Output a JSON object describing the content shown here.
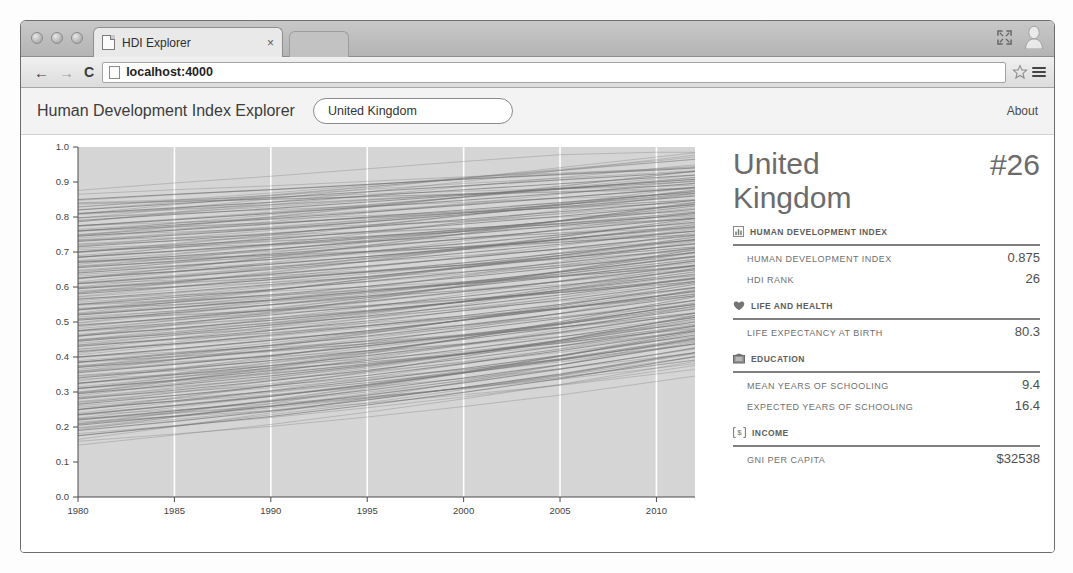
{
  "browser": {
    "tab_title": "HDI Explorer",
    "tab_close": "×",
    "url": "localhost:4000",
    "back": "←",
    "forward": "→",
    "reload": "C",
    "icons": {
      "favicon": "page-icon",
      "star": "star-icon",
      "menu": "hamburger-menu-icon",
      "fullscreen": "fullscreen-icon",
      "avatar": "user-avatar-icon"
    }
  },
  "app": {
    "title": "Human Development Index Explorer",
    "about_label": "About",
    "country_select": {
      "value": "United Kingdom",
      "placeholder": "United Kingdom"
    }
  },
  "detail": {
    "country_name": "United Kingdom",
    "rank_label": "#26",
    "sections": [
      {
        "icon": "bar-chart-icon",
        "title": "HUMAN DEVELOPMENT INDEX",
        "rows": [
          {
            "label": "HUMAN DEVELOPMENT INDEX",
            "value": "0.875"
          },
          {
            "label": "HDI RANK",
            "value": "26"
          }
        ]
      },
      {
        "icon": "heart-icon",
        "title": "LIFE AND HEALTH",
        "rows": [
          {
            "label": "LIFE EXPECTANCY AT BIRTH",
            "value": "80.3"
          }
        ]
      },
      {
        "icon": "book-icon",
        "title": "EDUCATION",
        "rows": [
          {
            "label": "MEAN YEARS OF SCHOOLING",
            "value": "9.4"
          },
          {
            "label": "EXPECTED YEARS OF SCHOOLING",
            "value": "16.4"
          }
        ]
      },
      {
        "icon": "dollar-icon",
        "title": "INCOME",
        "rows": [
          {
            "label": "GNI PER CAPITA",
            "value": "$32538"
          }
        ]
      }
    ]
  },
  "chart_data": {
    "type": "line",
    "title": "",
    "xlabel": "",
    "ylabel": "",
    "xlim": [
      1980,
      2012
    ],
    "ylim": [
      0.0,
      1.0
    ],
    "xticks": [
      1980,
      1985,
      1990,
      1995,
      2000,
      2005,
      2010
    ],
    "yticks": [
      "0.0",
      "0.1",
      "0.2",
      "0.3",
      "0.4",
      "0.5",
      "0.6",
      "0.7",
      "0.8",
      "0.9",
      "1.0"
    ],
    "grid": "vertical-white-gridlines",
    "legend": "none",
    "line_color": "#6e6e6e",
    "plot_background": "#d5d5d5",
    "series": [
      {
        "name": "country-001",
        "x": [
          1980,
          1985,
          1990,
          1995,
          2000,
          2005,
          2010,
          2012
        ],
        "values": [
          0.85,
          0.865,
          0.878,
          0.893,
          0.908,
          0.921,
          0.934,
          0.94
        ]
      },
      {
        "name": "country-002",
        "x": [
          1980,
          1985,
          1990,
          1995,
          2000,
          2005,
          2010,
          2012
        ],
        "values": [
          0.82,
          0.838,
          0.855,
          0.872,
          0.889,
          0.906,
          0.922,
          0.93
        ]
      },
      {
        "name": "country-003",
        "x": [
          1980,
          1985,
          1990,
          1995,
          2000,
          2005,
          2010,
          2012
        ],
        "values": [
          0.81,
          0.826,
          0.842,
          0.86,
          0.878,
          0.895,
          0.913,
          0.92
        ]
      },
      {
        "name": "country-004",
        "x": [
          1980,
          1985,
          1990,
          1995,
          2000,
          2005,
          2010,
          2012
        ],
        "values": [
          0.79,
          0.807,
          0.824,
          0.843,
          0.862,
          0.881,
          0.9,
          0.908
        ]
      },
      {
        "name": "country-005",
        "x": [
          1980,
          1985,
          1990,
          1995,
          2000,
          2005,
          2010,
          2012
        ],
        "values": [
          0.775,
          0.792,
          0.81,
          0.829,
          0.848,
          0.868,
          0.888,
          0.896
        ]
      },
      {
        "name": "country-006",
        "x": [
          1980,
          1985,
          1990,
          1995,
          2000,
          2005,
          2010,
          2012
        ],
        "values": [
          0.76,
          0.777,
          0.795,
          0.814,
          0.834,
          0.855,
          0.876,
          0.885
        ]
      },
      {
        "name": "country-007",
        "x": [
          1980,
          1985,
          1990,
          1995,
          2000,
          2005,
          2010,
          2012
        ],
        "values": [
          0.745,
          0.762,
          0.78,
          0.8,
          0.82,
          0.841,
          0.863,
          0.872
        ]
      },
      {
        "name": "country-008",
        "x": [
          1980,
          1985,
          1990,
          1995,
          2000,
          2005,
          2010,
          2012
        ],
        "values": [
          0.73,
          0.748,
          0.766,
          0.786,
          0.807,
          0.829,
          0.851,
          0.86
        ]
      },
      {
        "name": "country-009",
        "x": [
          1980,
          1985,
          1990,
          1995,
          2000,
          2005,
          2010,
          2012
        ],
        "values": [
          0.715,
          0.733,
          0.752,
          0.772,
          0.793,
          0.815,
          0.838,
          0.847
        ]
      },
      {
        "name": "country-010",
        "x": [
          1980,
          1985,
          1990,
          1995,
          2000,
          2005,
          2010,
          2012
        ],
        "values": [
          0.7,
          0.718,
          0.737,
          0.758,
          0.78,
          0.802,
          0.826,
          0.835
        ]
      },
      {
        "name": "country-011",
        "x": [
          1980,
          1985,
          1990,
          1995,
          2000,
          2005,
          2010,
          2012
        ],
        "values": [
          0.685,
          0.703,
          0.722,
          0.743,
          0.765,
          0.788,
          0.812,
          0.822
        ]
      },
      {
        "name": "country-012",
        "x": [
          1980,
          1985,
          1990,
          1995,
          2000,
          2005,
          2010,
          2012
        ],
        "values": [
          0.67,
          0.688,
          0.708,
          0.729,
          0.751,
          0.775,
          0.8,
          0.81
        ]
      },
      {
        "name": "country-013",
        "x": [
          1980,
          1985,
          1990,
          1995,
          2000,
          2005,
          2010,
          2012
        ],
        "values": [
          0.655,
          0.674,
          0.694,
          0.715,
          0.738,
          0.762,
          0.787,
          0.797
        ]
      },
      {
        "name": "country-014",
        "x": [
          1980,
          1985,
          1990,
          1995,
          2000,
          2005,
          2010,
          2012
        ],
        "values": [
          0.64,
          0.659,
          0.679,
          0.701,
          0.724,
          0.749,
          0.775,
          0.785
        ]
      },
      {
        "name": "country-015",
        "x": [
          1980,
          1985,
          1990,
          1995,
          2000,
          2005,
          2010,
          2012
        ],
        "values": [
          0.625,
          0.644,
          0.665,
          0.687,
          0.711,
          0.736,
          0.762,
          0.773
        ]
      },
      {
        "name": "country-016",
        "x": [
          1980,
          1985,
          1990,
          1995,
          2000,
          2005,
          2010,
          2012
        ],
        "values": [
          0.61,
          0.629,
          0.65,
          0.673,
          0.697,
          0.722,
          0.749,
          0.76
        ]
      },
      {
        "name": "country-017",
        "x": [
          1980,
          1985,
          1990,
          1995,
          2000,
          2005,
          2010,
          2012
        ],
        "values": [
          0.595,
          0.615,
          0.636,
          0.659,
          0.683,
          0.709,
          0.737,
          0.748
        ]
      },
      {
        "name": "country-018",
        "x": [
          1980,
          1985,
          1990,
          1995,
          2000,
          2005,
          2010,
          2012
        ],
        "values": [
          0.58,
          0.6,
          0.621,
          0.644,
          0.669,
          0.696,
          0.724,
          0.736
        ]
      },
      {
        "name": "country-019",
        "x": [
          1980,
          1985,
          1990,
          1995,
          2000,
          2005,
          2010,
          2012
        ],
        "values": [
          0.565,
          0.585,
          0.607,
          0.63,
          0.656,
          0.683,
          0.712,
          0.723
        ]
      },
      {
        "name": "country-020",
        "x": [
          1980,
          1985,
          1990,
          1995,
          2000,
          2005,
          2010,
          2012
        ],
        "values": [
          0.55,
          0.57,
          0.592,
          0.616,
          0.642,
          0.669,
          0.699,
          0.711
        ]
      },
      {
        "name": "country-021",
        "x": [
          1980,
          1985,
          1990,
          1995,
          2000,
          2005,
          2010,
          2012
        ],
        "values": [
          0.535,
          0.556,
          0.578,
          0.602,
          0.628,
          0.656,
          0.686,
          0.699
        ]
      },
      {
        "name": "country-022",
        "x": [
          1980,
          1985,
          1990,
          1995,
          2000,
          2005,
          2010,
          2012
        ],
        "values": [
          0.52,
          0.541,
          0.563,
          0.588,
          0.614,
          0.643,
          0.674,
          0.686
        ]
      },
      {
        "name": "country-023",
        "x": [
          1980,
          1985,
          1990,
          1995,
          2000,
          2005,
          2010,
          2012
        ],
        "values": [
          0.505,
          0.526,
          0.549,
          0.574,
          0.601,
          0.63,
          0.661,
          0.674
        ]
      },
      {
        "name": "country-024",
        "x": [
          1980,
          1985,
          1990,
          1995,
          2000,
          2005,
          2010,
          2012
        ],
        "values": [
          0.49,
          0.511,
          0.534,
          0.559,
          0.587,
          0.616,
          0.648,
          0.661
        ]
      },
      {
        "name": "country-025",
        "x": [
          1980,
          1985,
          1990,
          1995,
          2000,
          2005,
          2010,
          2012
        ],
        "values": [
          0.475,
          0.497,
          0.52,
          0.545,
          0.573,
          0.603,
          0.636,
          0.649
        ]
      },
      {
        "name": "country-026",
        "x": [
          1980,
          1985,
          1990,
          1995,
          2000,
          2005,
          2010,
          2012
        ],
        "values": [
          0.46,
          0.482,
          0.505,
          0.531,
          0.559,
          0.59,
          0.623,
          0.637
        ]
      },
      {
        "name": "country-027",
        "x": [
          1980,
          1985,
          1990,
          1995,
          2000,
          2005,
          2010,
          2012
        ],
        "values": [
          0.445,
          0.467,
          0.491,
          0.517,
          0.546,
          0.577,
          0.611,
          0.624
        ]
      },
      {
        "name": "country-028",
        "x": [
          1980,
          1985,
          1990,
          1995,
          2000,
          2005,
          2010,
          2012
        ],
        "values": [
          0.43,
          0.452,
          0.476,
          0.503,
          0.532,
          0.563,
          0.598,
          0.612
        ]
      },
      {
        "name": "country-029",
        "x": [
          1980,
          1985,
          1990,
          1995,
          2000,
          2005,
          2010,
          2012
        ],
        "values": [
          0.415,
          0.438,
          0.462,
          0.489,
          0.518,
          0.55,
          0.585,
          0.599
        ]
      },
      {
        "name": "country-030",
        "x": [
          1980,
          1985,
          1990,
          1995,
          2000,
          2005,
          2010,
          2012
        ],
        "values": [
          0.4,
          0.423,
          0.448,
          0.475,
          0.505,
          0.537,
          0.573,
          0.587
        ]
      },
      {
        "name": "country-031",
        "x": [
          1980,
          1985,
          1990,
          1995,
          2000,
          2005,
          2010,
          2012
        ],
        "values": [
          0.385,
          0.408,
          0.433,
          0.46,
          0.491,
          0.524,
          0.56,
          0.575
        ]
      },
      {
        "name": "country-032",
        "x": [
          1980,
          1985,
          1990,
          1995,
          2000,
          2005,
          2010,
          2012
        ],
        "values": [
          0.37,
          0.393,
          0.419,
          0.446,
          0.477,
          0.51,
          0.547,
          0.562
        ]
      },
      {
        "name": "country-033",
        "x": [
          1980,
          1985,
          1990,
          1995,
          2000,
          2005,
          2010,
          2012
        ],
        "values": [
          0.355,
          0.379,
          0.404,
          0.432,
          0.463,
          0.497,
          0.535,
          0.55
        ]
      },
      {
        "name": "country-034",
        "x": [
          1980,
          1985,
          1990,
          1995,
          2000,
          2005,
          2010,
          2012
        ],
        "values": [
          0.34,
          0.364,
          0.39,
          0.418,
          0.45,
          0.484,
          0.522,
          0.537
        ]
      },
      {
        "name": "country-035",
        "x": [
          1980,
          1985,
          1990,
          1995,
          2000,
          2005,
          2010,
          2012
        ],
        "values": [
          0.325,
          0.349,
          0.375,
          0.404,
          0.436,
          0.471,
          0.51,
          0.525
        ]
      },
      {
        "name": "country-036",
        "x": [
          1980,
          1985,
          1990,
          1995,
          2000,
          2005,
          2010,
          2012
        ],
        "values": [
          0.31,
          0.334,
          0.361,
          0.39,
          0.422,
          0.457,
          0.497,
          0.513
        ]
      },
      {
        "name": "country-037",
        "x": [
          1980,
          1985,
          1990,
          1995,
          2000,
          2005,
          2010,
          2012
        ],
        "values": [
          0.295,
          0.32,
          0.346,
          0.376,
          0.409,
          0.444,
          0.484,
          0.5
        ]
      },
      {
        "name": "country-038",
        "x": [
          1980,
          1985,
          1990,
          1995,
          2000,
          2005,
          2010,
          2012
        ],
        "values": [
          0.28,
          0.305,
          0.332,
          0.362,
          0.395,
          0.431,
          0.472,
          0.488
        ]
      },
      {
        "name": "country-039",
        "x": [
          1980,
          1985,
          1990,
          1995,
          2000,
          2005,
          2010,
          2012
        ],
        "values": [
          0.265,
          0.29,
          0.317,
          0.347,
          0.381,
          0.418,
          0.459,
          0.475
        ]
      },
      {
        "name": "country-040",
        "x": [
          1980,
          1985,
          1990,
          1995,
          2000,
          2005,
          2010,
          2012
        ],
        "values": [
          0.25,
          0.275,
          0.303,
          0.333,
          0.367,
          0.404,
          0.446,
          0.463
        ]
      },
      {
        "name": "country-041",
        "x": [
          1980,
          1985,
          1990,
          1995,
          2000,
          2005,
          2010,
          2012
        ],
        "values": [
          0.235,
          0.261,
          0.288,
          0.319,
          0.354,
          0.391,
          0.434,
          0.451
        ]
      },
      {
        "name": "country-042",
        "x": [
          1980,
          1985,
          1990,
          1995,
          2000,
          2005,
          2010,
          2012
        ],
        "values": [
          0.22,
          0.246,
          0.274,
          0.305,
          0.34,
          0.378,
          0.421,
          0.438
        ]
      },
      {
        "name": "country-043",
        "x": [
          1980,
          1985,
          1990,
          1995,
          2000,
          2005,
          2010,
          2012
        ],
        "values": [
          0.205,
          0.231,
          0.259,
          0.291,
          0.326,
          0.365,
          0.408,
          0.426
        ]
      },
      {
        "name": "country-044",
        "x": [
          1980,
          1985,
          1990,
          1995,
          2000,
          2005,
          2010,
          2012
        ],
        "values": [
          0.19,
          0.216,
          0.245,
          0.277,
          0.313,
          0.351,
          0.396,
          0.413
        ]
      },
      {
        "name": "country-045",
        "x": [
          1980,
          1985,
          1990,
          1995,
          2000,
          2005,
          2010,
          2012
        ],
        "values": [
          0.175,
          0.202,
          0.23,
          0.263,
          0.299,
          0.338,
          0.383,
          0.401
        ]
      }
    ]
  }
}
